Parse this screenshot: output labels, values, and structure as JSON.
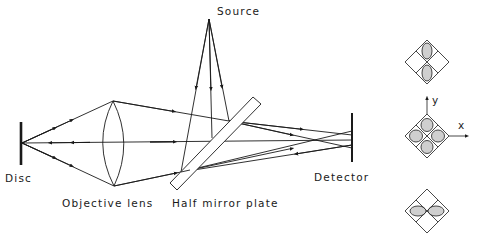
{
  "diagram": {
    "labels": {
      "source": "Source",
      "disc": "Disc",
      "objective_lens": "Objective lens",
      "half_mirror_plate": "Half mirror plate",
      "detector": "Detector",
      "axis_x": "x",
      "axis_y": "y"
    },
    "detector_patterns": [
      {
        "position": "top",
        "spot_shape": "vertical-ellipse"
      },
      {
        "position": "middle",
        "spot_shape": "circle-four-quadrant"
      },
      {
        "position": "bottom",
        "spot_shape": "horizontal-ellipse"
      }
    ],
    "colors": {
      "line": "#1a1a1a",
      "spot_fill": "#cfcfcf",
      "background": "#ffffff"
    }
  }
}
